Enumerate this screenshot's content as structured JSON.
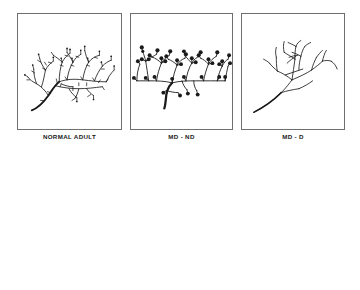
{
  "figure": {
    "rows": 2,
    "columns": 3,
    "background_color": "#ffffff",
    "ink_color": "#1a1a1a",
    "panel_border_color": "#6f6f72"
  },
  "captions": {
    "col1": "NORMAL ADULT",
    "col2": "MD - ND",
    "col3": "MD - D"
  },
  "top_row": {
    "description": "Camera-lucida style drawings of dendritic branch segments",
    "panels": [
      {
        "id": "dendrite-normal-adult",
        "caption": "NORMAL ADULT",
        "spine_type": "thin numerous spines",
        "spine_count": 46,
        "spine_head_radius": 0.9,
        "branch_style": "dense-horizontal",
        "has_spine_heads": false
      },
      {
        "id": "dendrite-md-nd",
        "caption": "MD - ND",
        "spine_type": "large bulbous spine heads",
        "spine_count": 38,
        "spine_head_radius": 2.1,
        "branch_style": "open-vertical",
        "has_spine_heads": true
      },
      {
        "id": "dendrite-md-d",
        "caption": "MD - D",
        "spine_type": "bare, spine-depleted",
        "spine_count": 0,
        "spine_head_radius": 0,
        "branch_style": "sparse-bare",
        "has_spine_heads": false
      }
    ]
  },
  "bottom_row": {
    "description": "Schematic electron-microscopy drawings of dendritic spine synapses",
    "panels": [
      {
        "id": "synapse-normal-adult",
        "spine_size": "medium",
        "mitochondria_count": 4,
        "vesicle_clusters": 2,
        "active_zones": 2,
        "terminal_shading": "gray"
      },
      {
        "id": "synapse-md-nd",
        "spine_size": "large enlarged",
        "mitochondria_count": 8,
        "vesicle_clusters": 3,
        "active_zones": 1,
        "terminal_shading": "gray"
      },
      {
        "id": "synapse-md-d",
        "spine_size": "small shrunken",
        "mitochondria_count": 2,
        "vesicle_clusters": 1,
        "active_zones": 1,
        "terminal_shading": "gray"
      }
    ]
  }
}
